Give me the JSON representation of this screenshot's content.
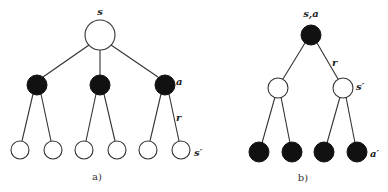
{
  "diagrams": [
    {
      "id": "a",
      "caption": "a)",
      "labels": {
        "root": "s",
        "action": "a",
        "reward": "r",
        "next_state": "s′"
      },
      "root": {
        "cx": 100,
        "cy": 35,
        "r": 15,
        "fill": "white"
      },
      "level1": [
        {
          "cx": 37,
          "cy": 85,
          "r": 10,
          "fill": "black"
        },
        {
          "cx": 100,
          "cy": 85,
          "r": 10,
          "fill": "black"
        },
        {
          "cx": 165,
          "cy": 85,
          "r": 10,
          "fill": "black"
        }
      ],
      "leaves": [
        {
          "cx": 20,
          "cy": 150,
          "r": 9,
          "parent": 0
        },
        {
          "cx": 53,
          "cy": 150,
          "r": 9,
          "parent": 0
        },
        {
          "cx": 84,
          "cy": 150,
          "r": 9,
          "parent": 1
        },
        {
          "cx": 117,
          "cy": 150,
          "r": 9,
          "parent": 1
        },
        {
          "cx": 148,
          "cy": 150,
          "r": 9,
          "parent": 2
        },
        {
          "cx": 181,
          "cy": 150,
          "r": 9,
          "parent": 2
        }
      ]
    },
    {
      "id": "b",
      "caption": "b)",
      "labels": {
        "root": "s,a",
        "reward": "r",
        "next_state": "s′",
        "next_action": "a′"
      },
      "root": {
        "cx": 311,
        "cy": 35,
        "r": 10,
        "fill": "black"
      },
      "level1": [
        {
          "cx": 278,
          "cy": 88,
          "r": 10,
          "fill": "white"
        },
        {
          "cx": 343,
          "cy": 88,
          "r": 10,
          "fill": "white"
        }
      ],
      "leaves": [
        {
          "cx": 259,
          "cy": 152,
          "r": 10,
          "parent": 0
        },
        {
          "cx": 292,
          "cy": 152,
          "r": 10,
          "parent": 0
        },
        {
          "cx": 324,
          "cy": 152,
          "r": 10,
          "parent": 1
        },
        {
          "cx": 357,
          "cy": 152,
          "r": 10,
          "parent": 1
        }
      ]
    }
  ]
}
